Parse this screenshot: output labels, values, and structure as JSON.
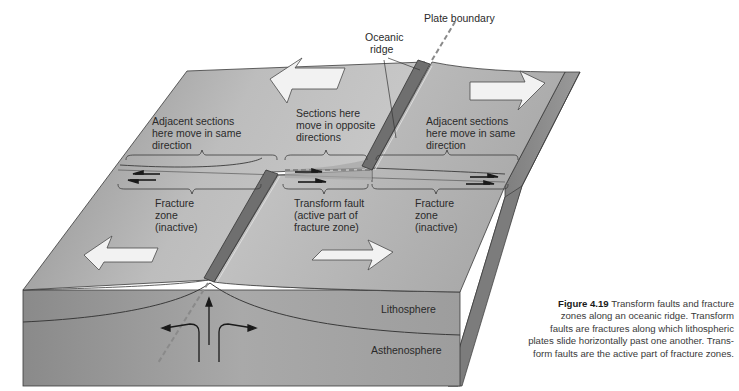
{
  "figure": {
    "number": "Figure 4.19",
    "caption_lines": [
      "Transform faults and fracture",
      "zones along an oceanic ridge. Transform",
      "faults are fractures along which lithospheric",
      "plates slide horizontally past one another. Trans-",
      "form faults are the active part of fracture zones."
    ]
  },
  "labels": {
    "plate_boundary": "Plate boundary",
    "oceanic_ridge": [
      "Oceanic",
      "ridge"
    ],
    "adjacent_left": [
      "Adjacent sections",
      "here move in same",
      "direction"
    ],
    "opposite_center": [
      "Sections here",
      "move in opposite",
      "directions"
    ],
    "adjacent_right": [
      "Adjacent sections",
      "here move in same",
      "direction"
    ],
    "fracture_left": [
      "Fracture",
      "zone",
      "(inactive)"
    ],
    "transform_fault": [
      "Transform fault",
      "(active part of",
      "fracture zone)"
    ],
    "fracture_right": [
      "Fracture",
      "zone",
      "(inactive)"
    ],
    "lithosphere": "Lithosphere",
    "asthenosphere": "Asthenosphere"
  },
  "colors": {
    "surface_light": "#cfcfcf",
    "surface_dark": "#8e8e8e",
    "ridge": "#6f6f6f",
    "front_face": "#9a9a9a",
    "side_face": "#7a7a7a",
    "arrow_fill": "#f2f2f2",
    "outline": "#3a3a3a"
  }
}
